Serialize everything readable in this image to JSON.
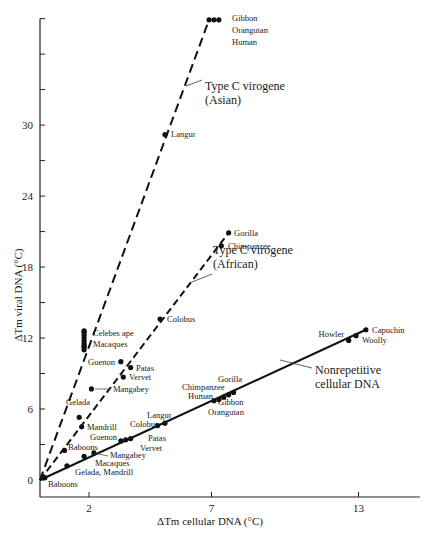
{
  "chart_data": {
    "type": "scatter",
    "title": "",
    "xlabel": "ΔTm cellular DNA (°C)",
    "ylabel": "ΔTm viral DNA (°C)",
    "xlim": [
      0,
      15.5
    ],
    "ylim": [
      0,
      39
    ],
    "x_ticks": [
      2,
      7,
      13
    ],
    "y_ticks": [
      0,
      6,
      12,
      18,
      24,
      30
    ],
    "y_minor_ticks": [
      3,
      9,
      15,
      21,
      27,
      33,
      36
    ],
    "grid": false,
    "legend": "none (series labeled inline)",
    "series": [
      {
        "name": "Type C virogene (Asian)",
        "label_line1": "Type C virogene",
        "label_line2": "(Asian)",
        "line_style": "dashed-long",
        "fit": [
          [
            0,
            0
          ],
          [
            6.9,
            38.9
          ]
        ],
        "points": [
          {
            "label": "Gibbon",
            "x": 6.9,
            "y": 38.9
          },
          {
            "label": "Orangutan",
            "x": 7.1,
            "y": 38.9
          },
          {
            "label": "Human",
            "x": 7.3,
            "y": 38.9
          },
          {
            "label": "Langur",
            "x": 5.1,
            "y": 29.2
          },
          {
            "label": "Celebes ape",
            "x": 1.8,
            "y": 12.6
          },
          {
            "label": "Macaques",
            "x": 1.8,
            "y": 11.3
          }
        ]
      },
      {
        "name": "Type C virogene (African)",
        "label_line1": "Type C virogene",
        "label_line2": "(African)",
        "line_style": "dashed",
        "fit": [
          [
            0,
            0
          ],
          [
            7.7,
            20.9
          ]
        ],
        "points": [
          {
            "label": "Gorilla",
            "x": 7.7,
            "y": 20.9
          },
          {
            "label": "Chimpanzee",
            "x": 7.4,
            "y": 19.8
          },
          {
            "label": "Colobus",
            "x": 4.9,
            "y": 13.6
          },
          {
            "label": "Guenon",
            "x": 3.3,
            "y": 10.0
          },
          {
            "label": "Patas",
            "x": 3.7,
            "y": 9.5
          },
          {
            "label": "Vervet",
            "x": 3.4,
            "y": 8.7
          },
          {
            "label": "Mangabey",
            "x": 2.1,
            "y": 7.7
          },
          {
            "label": "Gelada",
            "x": 1.6,
            "y": 5.3
          },
          {
            "label": "Mandrill",
            "x": 1.7,
            "y": 4.5
          },
          {
            "label": "Baboons",
            "x": 1.0,
            "y": 2.5
          }
        ]
      },
      {
        "name": "Nonrepetitive cellular DNA",
        "label_line1": "Nonrepetitive",
        "label_line2": "cellular DNA",
        "line_style": "solid",
        "fit": [
          [
            0,
            0
          ],
          [
            13.3,
            12.7
          ]
        ],
        "points": [
          {
            "label": "Capuchin",
            "x": 13.3,
            "y": 12.7
          },
          {
            "label": "Woolly",
            "x": 12.9,
            "y": 12.2
          },
          {
            "label": "Howler",
            "x": 12.6,
            "y": 11.8
          },
          {
            "label": "Gorilla",
            "x": 7.9,
            "y": 7.4
          },
          {
            "label": "Chimpanzee",
            "x": 7.7,
            "y": 7.2
          },
          {
            "label": "Human",
            "x": 7.5,
            "y": 7.0
          },
          {
            "label": "Gibbon",
            "x": 7.3,
            "y": 6.8
          },
          {
            "label": "Orangutan",
            "x": 7.1,
            "y": 6.7
          },
          {
            "label": "Langur",
            "x": 5.1,
            "y": 4.8
          },
          {
            "label": "Colobus",
            "x": 4.8,
            "y": 4.6
          },
          {
            "label": "Patas",
            "x": 3.7,
            "y": 3.5
          },
          {
            "label": "Vervet",
            "x": 3.5,
            "y": 3.4
          },
          {
            "label": "Guenon",
            "x": 3.3,
            "y": 3.3
          },
          {
            "label": "Mangabey",
            "x": 2.2,
            "y": 2.3
          },
          {
            "label": "Macaques",
            "x": 1.8,
            "y": 2.0
          },
          {
            "label": "Gelada, Mandrill",
            "x": 1.1,
            "y": 1.2
          },
          {
            "label": "Baboons",
            "x": 0.2,
            "y": 0.2
          }
        ]
      }
    ]
  }
}
